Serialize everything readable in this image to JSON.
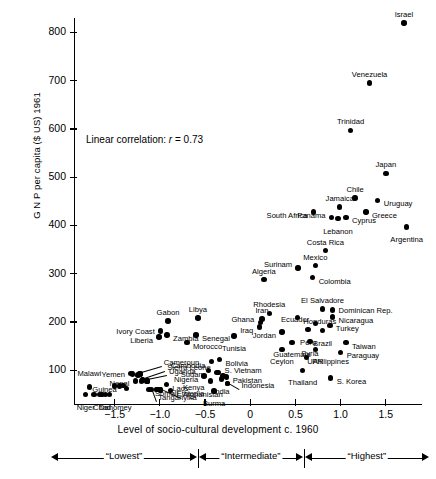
{
  "chart_data": {
    "type": "scatter",
    "title": "",
    "annotation": "Linear correlation: r = 0.73",
    "annotation_prefix": "Linear correlation: ",
    "annotation_italic": "r",
    "annotation_suffix": " = 0.73",
    "xlabel": "Level of socio-cultural development c. 1960",
    "ylabel": "G N P per capita ($ US) 1961",
    "xlim": [
      -1.95,
      1.9
    ],
    "ylim": [
      30,
      830
    ],
    "grid": false,
    "legend": null,
    "correlation_r": 0.73,
    "xticks": [
      -1.5,
      -1.0,
      -0.5,
      0,
      0.5,
      1.0,
      1.5
    ],
    "xticklabels": [
      "−1.5",
      "−1.0",
      "−0.5",
      "0",
      "0.5",
      "1.0",
      "1.5"
    ],
    "yticks": [
      100,
      200,
      300,
      400,
      500,
      600,
      700,
      800
    ],
    "yticklabels": [
      "100",
      "200",
      "300",
      "400",
      "500",
      "600",
      "700",
      "800"
    ],
    "points": [
      {
        "label": "Israel",
        "x": 1.7,
        "y": 820,
        "lx": 0,
        "ly": -9,
        "anchor": "c"
      },
      {
        "label": "Venezuela",
        "x": 1.32,
        "y": 695,
        "lx": 0,
        "ly": -9,
        "anchor": "c"
      },
      {
        "label": "Trinidad",
        "x": 1.11,
        "y": 597,
        "lx": 0,
        "ly": -9,
        "anchor": "c"
      },
      {
        "label": "Japan",
        "x": 1.5,
        "y": 508,
        "lx": 0,
        "ly": -9,
        "anchor": "c"
      },
      {
        "label": "Chile",
        "x": 1.16,
        "y": 457,
        "lx": 0,
        "ly": -9,
        "anchor": "c"
      },
      {
        "label": "Uruguay",
        "x": 1.41,
        "y": 452,
        "lx": 6,
        "ly": 3,
        "anchor": "l"
      },
      {
        "label": "Jamaica",
        "x": 0.99,
        "y": 438,
        "lx": 0,
        "ly": -9,
        "anchor": "c"
      },
      {
        "label": "Greece",
        "x": 1.28,
        "y": 428,
        "lx": 6,
        "ly": 3,
        "anchor": "l"
      },
      {
        "label": "South Africa",
        "x": 0.7,
        "y": 428,
        "lx": -6,
        "ly": 3,
        "anchor": "r"
      },
      {
        "label": "Panama",
        "x": 0.9,
        "y": 417,
        "lx": -6,
        "ly": -2,
        "anchor": "r"
      },
      {
        "label": "Lebanon",
        "x": 0.97,
        "y": 414,
        "lx": 0,
        "ly": 12,
        "anchor": "c"
      },
      {
        "label": "Cyprus",
        "x": 1.06,
        "y": 417,
        "lx": 6,
        "ly": 3,
        "anchor": "l"
      },
      {
        "label": "Argentina",
        "x": 1.73,
        "y": 397,
        "lx": 0,
        "ly": 12,
        "anchor": "c"
      },
      {
        "label": "Costa Rica",
        "x": 0.83,
        "y": 348,
        "lx": 0,
        "ly": -9,
        "anchor": "c"
      },
      {
        "label": "Mexico",
        "x": 0.72,
        "y": 317,
        "lx": 0,
        "ly": -9,
        "anchor": "c"
      },
      {
        "label": "Surinam",
        "x": 0.53,
        "y": 312,
        "lx": -6,
        "ly": -4,
        "anchor": "r"
      },
      {
        "label": "Colombia",
        "x": 0.69,
        "y": 292,
        "lx": 6,
        "ly": 3,
        "anchor": "l"
      },
      {
        "label": "Algeria",
        "x": 0.15,
        "y": 288,
        "lx": 0,
        "ly": -9,
        "anchor": "c"
      },
      {
        "label": "El Salvadore",
        "x": 0.8,
        "y": 227,
        "lx": 0,
        "ly": -9,
        "anchor": "c"
      },
      {
        "label": "Dominican Rep.",
        "x": 0.91,
        "y": 225,
        "lx": 6,
        "ly": 0,
        "anchor": "l"
      },
      {
        "label": "Rhodesia",
        "x": 0.21,
        "y": 218,
        "lx": 0,
        "ly": -9,
        "anchor": "c"
      },
      {
        "label": "Nicaragua",
        "x": 0.91,
        "y": 210,
        "lx": 6,
        "ly": 3,
        "anchor": "l"
      },
      {
        "label": "Libya",
        "x": -0.58,
        "y": 208,
        "lx": 0,
        "ly": -9,
        "anchor": "c"
      },
      {
        "label": "Gabon",
        "x": -0.91,
        "y": 202,
        "lx": 0,
        "ly": -9,
        "anchor": "c"
      },
      {
        "label": "Iran",
        "x": 0.13,
        "y": 206,
        "lx": 0,
        "ly": -9,
        "anchor": "c"
      },
      {
        "label": "Honduras",
        "x": 0.52,
        "y": 209,
        "lx": 6,
        "ly": 3,
        "anchor": "l"
      },
      {
        "label": "Ghana",
        "x": 0.11,
        "y": 199,
        "lx": -6,
        "ly": -3,
        "anchor": "r"
      },
      {
        "label": "Turkey",
        "x": 0.88,
        "y": 193,
        "lx": 6,
        "ly": 3,
        "anchor": "l"
      },
      {
        "label": "Ecuador",
        "x": 0.72,
        "y": 197,
        "lx": -6,
        "ly": -4,
        "anchor": "r"
      },
      {
        "label": "Iraq",
        "x": 0.1,
        "y": 190,
        "lx": -6,
        "ly": 3,
        "anchor": "r"
      },
      {
        "label": "Ivory Coast",
        "x": -0.99,
        "y": 181,
        "lx": -6,
        "ly": 0,
        "anchor": "r"
      },
      {
        "label": "Brazil",
        "x": 0.8,
        "y": 182,
        "lx": 0,
        "ly": 12,
        "anchor": "c"
      },
      {
        "label": "Peru",
        "x": 0.64,
        "y": 184,
        "lx": 0,
        "ly": 12,
        "anchor": "c"
      },
      {
        "label": "Jordan",
        "x": 0.35,
        "y": 179,
        "lx": -6,
        "ly": 3,
        "anchor": "r"
      },
      {
        "label": "Zambia",
        "x": -0.92,
        "y": 173,
        "lx": 6,
        "ly": 3,
        "anchor": "l"
      },
      {
        "label": "Senegal",
        "x": -0.6,
        "y": 173,
        "lx": 6,
        "ly": 3,
        "anchor": "l"
      },
      {
        "label": "Liberia",
        "x": -1.01,
        "y": 169,
        "lx": -6,
        "ly": 3,
        "anchor": "r"
      },
      {
        "label": "Tunisia",
        "x": -0.18,
        "y": 171,
        "lx": 0,
        "ly": 12,
        "anchor": "c"
      },
      {
        "label": "Syria",
        "x": 0.66,
        "y": 160,
        "lx": 0,
        "ly": 12,
        "anchor": "c"
      },
      {
        "label": "Morocco",
        "x": -0.7,
        "y": 157,
        "lx": 6,
        "ly": 3,
        "anchor": "l"
      },
      {
        "label": "Guatemala",
        "x": 0.46,
        "y": 158,
        "lx": 0,
        "ly": 12,
        "anchor": "c"
      },
      {
        "label": "Taiwan",
        "x": 1.06,
        "y": 157,
        "lx": 6,
        "ly": 3,
        "anchor": "l"
      },
      {
        "label": "UAR",
        "x": 0.72,
        "y": 143,
        "lx": 0,
        "ly": 12,
        "anchor": "c"
      },
      {
        "label": "Paraguay",
        "x": 1.0,
        "y": 137,
        "lx": 6,
        "ly": 3,
        "anchor": "l"
      },
      {
        "label": "Ceylon",
        "x": 0.35,
        "y": 143,
        "lx": 0,
        "ly": 12,
        "anchor": "c"
      },
      {
        "label": "Philippines",
        "x": 0.62,
        "y": 126,
        "lx": 6,
        "ly": 3,
        "anchor": "l"
      },
      {
        "label": "Bolivia",
        "x": -0.34,
        "y": 122,
        "lx": 6,
        "ly": 3,
        "anchor": "l"
      },
      {
        "label": "Cambodia",
        "x": -0.43,
        "y": 118,
        "lx": -6,
        "ly": 3,
        "anchor": "r"
      },
      {
        "label": "S. Korea",
        "x": 0.89,
        "y": 84,
        "lx": 6,
        "ly": 3,
        "anchor": "l"
      },
      {
        "label": "Thailand",
        "x": 0.58,
        "y": 100,
        "lx": 0,
        "ly": 12,
        "anchor": "c"
      },
      {
        "label": "Sudan",
        "x": -0.46,
        "y": 99,
        "lx": -6,
        "ly": 3,
        "anchor": "r"
      },
      {
        "label": "S. Vietnam",
        "x": -0.35,
        "y": 95,
        "lx": 6,
        "ly": -3,
        "anchor": "l"
      },
      {
        "label": "Nigeria",
        "x": -0.51,
        "y": 88,
        "lx": -6,
        "ly": 3,
        "anchor": "r"
      },
      {
        "label": "Pakistan",
        "x": -0.26,
        "y": 86,
        "lx": 6,
        "ly": 3,
        "anchor": "l"
      },
      {
        "label": "India",
        "x": -0.32,
        "y": 82,
        "lx": 0,
        "ly": 12,
        "anchor": "c"
      },
      {
        "label": "Kenya",
        "x": -0.44,
        "y": 78,
        "lx": -6,
        "ly": 6,
        "anchor": "r"
      },
      {
        "label": "Yemen",
        "x": -1.32,
        "y": 93,
        "lx": -6,
        "ly": 0,
        "anchor": "r"
      },
      {
        "label": "Nepal",
        "x": -1.27,
        "y": 78,
        "lx": -6,
        "ly": 2,
        "anchor": "r"
      },
      {
        "label": "Malawi",
        "x": -1.78,
        "y": 65,
        "lx": 0,
        "ly": -14,
        "anchor": "c"
      },
      {
        "label": "Guinea",
        "x": -1.41,
        "y": 68,
        "lx": -6,
        "ly": 3,
        "anchor": "r"
      },
      {
        "label": "Laos",
        "x": -0.93,
        "y": 70,
        "lx": 6,
        "ly": 3,
        "anchor": "l"
      },
      {
        "label": "Somali",
        "x": -1.12,
        "y": 60,
        "lx": 6,
        "ly": 3,
        "anchor": "l"
      },
      {
        "label": "Ethiopia",
        "x": -0.88,
        "y": 58,
        "lx": 6,
        "ly": 3,
        "anchor": "l"
      },
      {
        "label": "Burma",
        "x": -0.4,
        "y": 57,
        "lx": 0,
        "ly": 12,
        "anchor": "c"
      },
      {
        "label": "Niger",
        "x": -1.82,
        "y": 50,
        "lx": 0,
        "ly": 13,
        "anchor": "c"
      },
      {
        "label": "Chad",
        "x": -1.64,
        "y": 50,
        "lx": 0,
        "ly": 13,
        "anchor": "c"
      },
      {
        "label": "Dahomey",
        "x": -1.56,
        "y": 50,
        "lx": 6,
        "ly": 13,
        "anchor": "c"
      },
      {
        "label": "Cameroun",
        "x": -1.22,
        "y": 92,
        "lx": 0,
        "ly": 0,
        "anchor": "none"
      },
      {
        "label": "Sierra Leone",
        "x": -1.19,
        "y": 80,
        "lx": 0,
        "ly": 0,
        "anchor": "none"
      },
      {
        "label": "Uganda",
        "x": -1.14,
        "y": 78,
        "lx": 0,
        "ly": 0,
        "anchor": "none"
      },
      {
        "label": "Tanganyika",
        "x": -1.04,
        "y": 60,
        "lx": 0,
        "ly": 0,
        "anchor": "none"
      },
      {
        "label": "Afghanistan",
        "x": -0.99,
        "y": 59,
        "lx": 0,
        "ly": 0,
        "anchor": "none"
      },
      {
        "label": "Indonesia",
        "x": -0.25,
        "y": 72,
        "lx": 0,
        "ly": 0,
        "anchor": "none"
      }
    ],
    "unlabeled_points": [
      {
        "x": -1.3,
        "y": 92
      },
      {
        "x": -1.24,
        "y": 90
      },
      {
        "x": -1.2,
        "y": 78
      },
      {
        "x": -1.15,
        "y": 78
      },
      {
        "x": -1.09,
        "y": 60
      },
      {
        "x": -1.01,
        "y": 60
      },
      {
        "x": -1.5,
        "y": 67
      },
      {
        "x": -1.45,
        "y": 67
      },
      {
        "x": -1.37,
        "y": 62
      },
      {
        "x": -1.73,
        "y": 50
      },
      {
        "x": -1.67,
        "y": 50
      },
      {
        "x": -1.6,
        "y": 50
      },
      {
        "x": -0.37,
        "y": 95
      },
      {
        "x": -0.3,
        "y": 88
      }
    ],
    "leader_labels": [
      {
        "name": "Cameroun",
        "from": [
          -0.98,
          106
        ],
        "to": [
          -1.235,
          92
        ]
      },
      {
        "name": "Sierra Leone",
        "from": [
          -0.94,
          96
        ],
        "to": [
          -1.19,
          80
        ]
      },
      {
        "name": "Uganda",
        "from": [
          -0.92,
          88
        ],
        "to": [
          -1.15,
          79
        ]
      },
      {
        "name": "Tanganyika",
        "from": [
          -1.04,
          34
        ],
        "to": [
          -1.09,
          60
        ]
      },
      {
        "name": "Afghanistan",
        "from": [
          -0.77,
          40
        ],
        "to": [
          -0.99,
          59
        ]
      },
      {
        "name": "Indonesia",
        "from": [
          -0.12,
          58
        ],
        "to": [
          -0.25,
          72
        ]
      }
    ],
    "category_bands": [
      {
        "label": "“Lowest”",
        "from": -1.95,
        "to": -0.45
      },
      {
        "label": "“Intermediate”",
        "from": -0.45,
        "to": 0.62
      },
      {
        "label": "“Highest”",
        "from": 0.62,
        "to": 1.9
      }
    ]
  }
}
